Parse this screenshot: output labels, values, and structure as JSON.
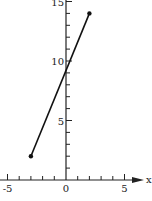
{
  "chart_data": {
    "type": "line",
    "title": "",
    "xlabel": "x",
    "ylabel": "",
    "xlim": [
      -5.5,
      5.5
    ],
    "ylim": [
      0,
      15
    ],
    "grid": false,
    "x_ticks": [
      -5,
      0,
      5
    ],
    "x_tick_labels": [
      "-5",
      "0",
      "5"
    ],
    "y_ticks": [
      5,
      10,
      15
    ],
    "y_tick_labels": [
      "5",
      "10",
      "15"
    ],
    "x_minor_tick_step": 1,
    "y_minor_tick_step": 1,
    "series": [
      {
        "name": "segment",
        "x": [
          -3,
          2
        ],
        "y": [
          2,
          14
        ],
        "endpoints": "filled-dots",
        "color": "#111111"
      }
    ]
  }
}
